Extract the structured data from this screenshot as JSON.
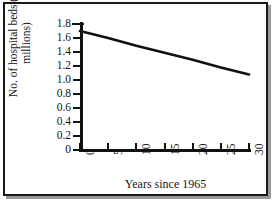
{
  "chart_data": {
    "type": "line",
    "title": "",
    "xlabel": "Years since 1965",
    "ylabel": "No. of hospital beds (in millions)",
    "ylabel_line1": "No. of hospital beds (in",
    "ylabel_line2": "millions)",
    "x": [
      0,
      30
    ],
    "values": [
      1.7,
      1.08
    ],
    "series": [
      {
        "name": "Hospital beds",
        "x": [
          0,
          5,
          10,
          15,
          20,
          25,
          30
        ],
        "values": [
          1.7,
          1.6,
          1.49,
          1.39,
          1.29,
          1.18,
          1.08
        ]
      }
    ],
    "x_ticks": [
      "0",
      "5",
      "10",
      "15",
      "20",
      "25",
      "30"
    ],
    "x_tick_values": [
      0,
      5,
      10,
      15,
      20,
      25,
      30
    ],
    "y_ticks": [
      "0",
      "0.2",
      "0.4",
      "0.6",
      "0.8",
      "1.0",
      "1.2",
      "1.4",
      "1.6",
      "1.8"
    ],
    "y_tick_values": [
      0,
      0.2,
      0.4,
      0.6,
      0.8,
      1.0,
      1.2,
      1.4,
      1.6,
      1.8
    ],
    "xlim": [
      0,
      30
    ],
    "ylim": [
      0,
      1.8
    ],
    "grid": false,
    "legend": false,
    "line_color": "#111111",
    "axis_color": "#111111",
    "background_color": "#ffffff",
    "frame_color": "#1a1a1a"
  }
}
